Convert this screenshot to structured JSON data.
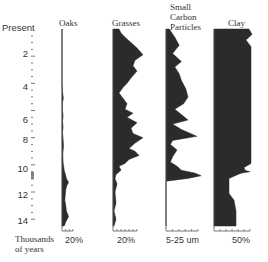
{
  "chart_data": {
    "type": "area",
    "title": "",
    "ylabel": "Thousands of years",
    "yaxis": {
      "top_label": "Present",
      "ticks": [
        2,
        4,
        6,
        8,
        10,
        12,
        14
      ],
      "range": [
        0,
        14.5
      ],
      "minor_step": 0.5
    },
    "panels": [
      {
        "name": "Oaks",
        "scale_label": "20%",
        "unit": "%",
        "depth": [
          0,
          4.0,
          4.6,
          5.1,
          5.5,
          6.0,
          6.4,
          6.8,
          7.2,
          7.6,
          8.1,
          8.6,
          9.2,
          9.8,
          10.4,
          10.8,
          11.0,
          11.3,
          11.5,
          11.8,
          12.2,
          12.6,
          13.0,
          13.4,
          13.8,
          14.2,
          14.5
        ],
        "values": [
          0,
          0,
          1,
          2.5,
          0.5,
          1,
          2,
          1,
          2,
          1,
          2,
          3,
          1.5,
          2,
          4,
          7,
          8,
          12,
          9,
          7,
          6,
          5,
          7,
          8,
          12,
          7,
          4
        ]
      },
      {
        "name": "Grasses",
        "scale_label": "20%",
        "unit": "%",
        "depth": [
          0,
          0.3,
          0.6,
          1.0,
          1.4,
          1.9,
          2.3,
          2.7,
          3.1,
          3.6,
          4.0,
          4.3,
          4.7,
          5.1,
          5.5,
          5.9,
          6.2,
          6.5,
          6.9,
          7.3,
          7.7,
          8.0,
          8.4,
          8.8,
          9.0,
          9.3,
          9.6,
          9.9,
          10.1,
          10.4,
          10.7,
          11.0,
          11.4,
          12.0,
          12.8,
          13.4,
          14.0,
          14.5
        ],
        "values": [
          6,
          8,
          12,
          18,
          24,
          30,
          22,
          20,
          24,
          18,
          14,
          10,
          6,
          10,
          14,
          12,
          20,
          14,
          24,
          18,
          20,
          30,
          22,
          16,
          22,
          26,
          16,
          12,
          6,
          8,
          3,
          2,
          4,
          2,
          3,
          1,
          3,
          1
        ]
      },
      {
        "name": "Small Carbon Particles",
        "scale_label": "5-25 um",
        "unit": "um",
        "depth": [
          0,
          0.6,
          1.2,
          1.8,
          2.4,
          2.8,
          3.3,
          3.8,
          4.4,
          5.0,
          5.5,
          5.9,
          6.3,
          6.7,
          7.0,
          7.4,
          7.9,
          8.2,
          8.5,
          8.9,
          9.4,
          9.8,
          10.1,
          10.4,
          10.6,
          10.8,
          11.0,
          11.2,
          14.5
        ],
        "values": [
          3,
          8,
          12,
          6,
          14,
          8,
          12,
          14,
          18,
          20,
          16,
          8,
          14,
          20,
          6,
          14,
          28,
          6,
          4,
          10,
          6,
          4,
          10,
          14,
          26,
          32,
          20,
          0,
          0
        ]
      },
      {
        "name": "Clay",
        "scale_label": "50%",
        "unit": "%",
        "depth": [
          0,
          0.4,
          0.8,
          1.3,
          9.9,
          10.2,
          10.4,
          10.5,
          10.6,
          10.7,
          11.0,
          12.1,
          12.6,
          13.4,
          14.5
        ],
        "values": [
          70,
          76,
          64,
          74,
          74,
          60,
          62,
          72,
          56,
          48,
          30,
          30,
          40,
          44,
          44
        ]
      }
    ]
  },
  "labels": {
    "present": "Present",
    "yaxis_line1": "Thousands",
    "yaxis_line2": "of years",
    "oaks": "Oaks",
    "grasses": "Grasses",
    "carbon_1": "Small",
    "carbon_2": "Carbon",
    "carbon_3": "Particles",
    "clay": "Clay",
    "oaks_scale": "20%",
    "grasses_scale": "20%",
    "carbon_scale": "5-25 um",
    "clay_scale": "50%",
    "tick_2": "2",
    "tick_4": "4",
    "tick_6": "6",
    "tick_8": "8",
    "tick_10": "10",
    "tick_12": "12",
    "tick_14": "14"
  },
  "colors": {
    "fill": "#2b2b2b",
    "axis": "#555555",
    "text": "#333333",
    "background": "#ffffff"
  }
}
